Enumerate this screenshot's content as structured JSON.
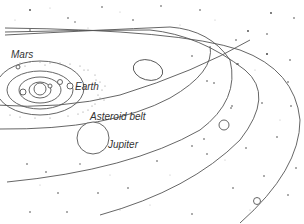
{
  "diagram": {
    "type": "solar-system-illustration",
    "colors": {
      "line": "#555555",
      "star": "#444444",
      "background": "#ffffff"
    },
    "labels": {
      "mars": "Mars",
      "earth": "Earth",
      "asteroid_belt": "Asteroid belt",
      "jupiter": "Jupiter"
    }
  }
}
